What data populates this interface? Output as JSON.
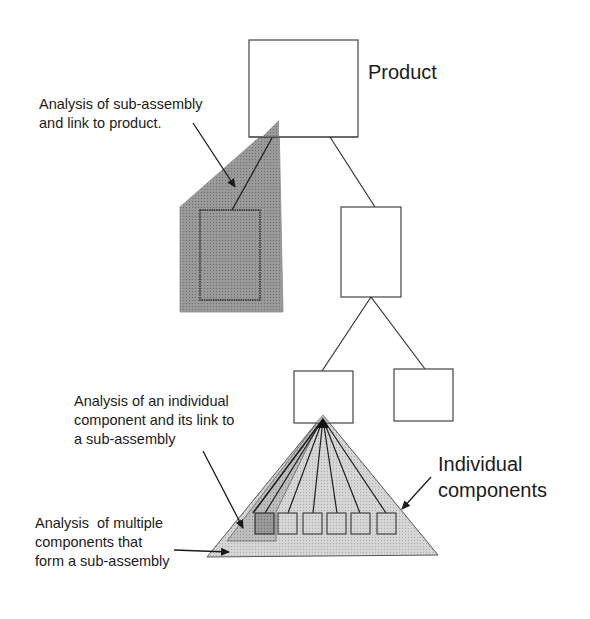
{
  "diagram": {
    "nodes": {
      "product": {
        "label": "Product"
      },
      "sub_assembly_box": {
        "label": ""
      },
      "sub_assembly_child_left": {
        "label": ""
      },
      "sub_assembly_child_right": {
        "label": ""
      }
    },
    "components": {
      "count": 6,
      "label_lines": [
        "Individual",
        "components"
      ]
    },
    "annotations": {
      "sub_assembly_analysis": {
        "lines": [
          "Analysis of sub-assembly",
          "and link to product."
        ]
      },
      "individual_component_analysis": {
        "lines": [
          "Analysis of an individual",
          "component and its link to",
          "a sub-assembly"
        ]
      },
      "multiple_components_analysis": {
        "lines": [
          "Analysis  of multiple",
          "components that",
          "form a sub-assembly"
        ]
      }
    },
    "colors": {
      "line": "#333333",
      "shade_dark": "#8e8e8e",
      "shade_medium": "#b4b4b4",
      "shade_light": "#cfcfcf",
      "box_fill": "#ffffff"
    }
  }
}
